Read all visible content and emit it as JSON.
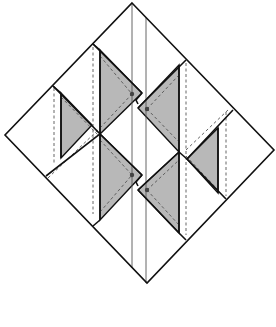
{
  "diagram": {
    "title": "",
    "colors": {
      "outline": "#111111",
      "shade": "#b8b8b8",
      "guide": "#555555",
      "dot": "#444444",
      "background": "#ffffff"
    },
    "outer_diamond": {
      "top": [
        132,
        3
      ],
      "right": [
        274,
        150
      ],
      "bottom": [
        147,
        283
      ],
      "left": [
        5,
        135
      ]
    },
    "center_lines": [
      {
        "x": 132,
        "y1": 3,
        "y2": 268
      },
      {
        "x": 146,
        "y1": 18,
        "y2": 283
      }
    ],
    "shaded_triangles": [
      {
        "name": "left-small",
        "points": [
          [
            61,
            93
          ],
          [
            92,
            125
          ],
          [
            61,
            158
          ]
        ]
      },
      {
        "name": "upper-left-tall",
        "points": [
          [
            100,
            50
          ],
          [
            142,
            93
          ],
          [
            100,
            134
          ]
        ]
      },
      {
        "name": "lower-left-tall",
        "points": [
          [
            100,
            134
          ],
          [
            142,
            175
          ],
          [
            100,
            220
          ]
        ]
      },
      {
        "name": "upper-right-tall",
        "points": [
          [
            179,
            65
          ],
          [
            179,
            152
          ],
          [
            138,
            108
          ]
        ]
      },
      {
        "name": "lower-right-tall",
        "points": [
          [
            179,
            152
          ],
          [
            179,
            233
          ],
          [
            138,
            190
          ]
        ]
      },
      {
        "name": "right-small",
        "points": [
          [
            218,
            128
          ],
          [
            218,
            193
          ],
          [
            187,
            159
          ]
        ]
      }
    ],
    "markers": [
      {
        "x": 132,
        "y": 94
      },
      {
        "x": 147,
        "y": 109
      },
      {
        "x": 132,
        "y": 175
      },
      {
        "x": 147,
        "y": 190
      }
    ],
    "caption": ""
  }
}
